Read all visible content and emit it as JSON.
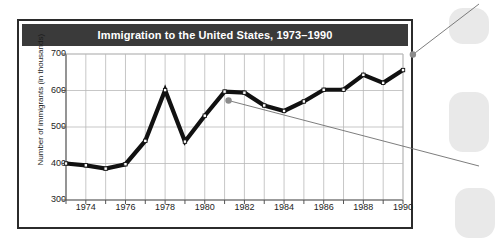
{
  "figure": {
    "title": "Immigration to the United States, 1973–1990",
    "colors": {
      "title_bar_bg": "#3a3a3a",
      "title_text": "#ffffff",
      "frame_border": "#2b2b2b",
      "grid": "#b9b9b9",
      "axis": "#7d7d7d",
      "series_line": "#111111",
      "marker_fill": "#ffffff",
      "marker_stroke": "#111111",
      "callout_dot": "#8c8c8c",
      "callout_line": "#6e6e6e",
      "plot_bg": "#ffffff"
    }
  },
  "chart_data": {
    "type": "line",
    "title": "Immigration to the United States, 1973–1990",
    "xlabel": "",
    "ylabel": "Number of immigrants (in thousands)",
    "xlim": [
      1973,
      1990
    ],
    "ylim": [
      300,
      700
    ],
    "yticks": [
      300,
      400,
      500,
      600,
      700
    ],
    "ytick_labels": [
      "300",
      "400",
      "500",
      "600",
      "700"
    ],
    "xticks": [
      1974,
      1976,
      1978,
      1980,
      1982,
      1984,
      1986,
      1988,
      1990
    ],
    "xtick_labels": [
      "1974",
      "1976",
      "1978",
      "1980",
      "1982",
      "1984",
      "1986",
      "1988",
      "1990"
    ],
    "grid": true,
    "legend": null,
    "x": [
      1973,
      1974,
      1975,
      1976,
      1977,
      1978,
      1979,
      1980,
      1981,
      1982,
      1983,
      1984,
      1985,
      1986,
      1987,
      1988,
      1989,
      1990
    ],
    "series": [
      {
        "name": "Number of immigrants (in thousands)",
        "values": [
          400,
          395,
          386,
          398,
          462,
          601,
          460,
          531,
          597,
          594,
          559,
          544,
          570,
          602,
          602,
          643,
          621,
          656
        ]
      }
    ],
    "annotations": [
      {
        "name": "callout-dot-1990",
        "x": 1990.6,
        "y": 693,
        "note": "gray callout dot near 1990 data point with leader line exiting to upper right"
      },
      {
        "name": "callout-dot-1981",
        "x": 1981.3,
        "y": 567,
        "note": "gray callout dot below the 1981 peak with leader line exiting to lower right"
      }
    ]
  }
}
